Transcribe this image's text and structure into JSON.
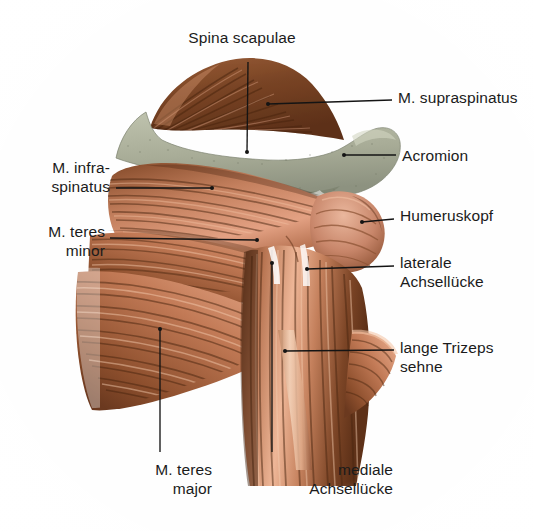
{
  "figure": {
    "language": "de",
    "background_color": "#fefefe",
    "bone_color": "#a8ac97",
    "bone_shadow_color": "#8d9280",
    "muscle_light_color": "#e8a588",
    "muscle_mid_color": "#c07a5c",
    "muscle_dark_color": "#6b3d26",
    "supraspinatus_color": "#7d4526",
    "tendon_color": "#f0cdb6",
    "leader_color": "#141414",
    "text_color": "#1b1b1b"
  },
  "labels": [
    {
      "id": "spina-scapulae",
      "text": "Spina scapulae",
      "side": "top",
      "x": 237,
      "y": 28,
      "align": "c"
    },
    {
      "id": "m-supraspinatus",
      "text": "M. supraspinatus",
      "side": "right",
      "x": 398,
      "y": 88,
      "align": "r"
    },
    {
      "id": "acromion",
      "text": "Acromion",
      "side": "right",
      "x": 402,
      "y": 146,
      "align": "r"
    },
    {
      "id": "m-infraspinatus",
      "text": "M. infra-\nspinatus",
      "side": "left",
      "x": 35,
      "y": 158,
      "align": "l"
    },
    {
      "id": "humeruskopf",
      "text": "Humeruskopf",
      "side": "right",
      "x": 400,
      "y": 206,
      "align": "r"
    },
    {
      "id": "m-teres-minor",
      "text": "M. teres\nminor",
      "side": "left",
      "x": 35,
      "y": 222,
      "align": "l"
    },
    {
      "id": "laterale-achsellucke",
      "text": "laterale\nAchsellücke",
      "side": "right",
      "x": 400,
      "y": 253,
      "align": "r"
    },
    {
      "id": "lange-trizeps-sehne",
      "text": "lange Trizeps\nsehne",
      "side": "right",
      "x": 400,
      "y": 338,
      "align": "r"
    },
    {
      "id": "m-teres-major",
      "text": "M. teres\nmajor",
      "side": "bottom",
      "x": 120,
      "y": 460,
      "align": "l"
    },
    {
      "id": "mediale-achsellucke",
      "text": "mediale\nAchsellücke",
      "side": "bottom",
      "x": 263,
      "y": 460,
      "align": "l"
    }
  ],
  "structures": [
    {
      "id": "spina-scapulae",
      "name": "Spina scapulae",
      "type": "bone",
      "pointer": [
        247,
        152
      ]
    },
    {
      "id": "acromion",
      "name": "Acromion",
      "type": "bone",
      "pointer": [
        342,
        155
      ]
    },
    {
      "id": "m-supraspinatus",
      "name": "M. supraspinatus",
      "type": "muscle",
      "pointer": [
        262,
        104
      ]
    },
    {
      "id": "m-infraspinatus",
      "name": "M. infraspinatus",
      "type": "muscle",
      "pointer": [
        210,
        188
      ]
    },
    {
      "id": "m-teres-minor",
      "name": "M. teres minor",
      "type": "muscle",
      "pointer": [
        257,
        240
      ]
    },
    {
      "id": "m-teres-major",
      "name": "M. teres major",
      "type": "muscle",
      "pointer": [
        160,
        329
      ]
    },
    {
      "id": "humeruskopf",
      "name": "Humeruskopf",
      "type": "bone",
      "pointer": [
        362,
        221
      ]
    },
    {
      "id": "laterale-achsellucke",
      "name": "laterale Achsellücke",
      "type": "space",
      "pointer": [
        307,
        269
      ]
    },
    {
      "id": "mediale-achsellucke",
      "name": "mediale Achsellücke",
      "type": "space",
      "pointer": [
        271,
        263
      ]
    },
    {
      "id": "lange-trizeps-sehne",
      "name": "lange Trizeps sehne",
      "type": "tendon",
      "pointer": [
        285,
        351
      ]
    }
  ]
}
